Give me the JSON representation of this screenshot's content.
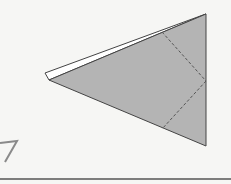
{
  "diagram": {
    "type": "origami-fold-step",
    "colors": {
      "background": "#f6f6f4",
      "paper_fill": "#b4b4b4",
      "flap_fill": "#ffffff",
      "outline": "#444444",
      "dashed": "#555555",
      "baseline": "#555555"
    },
    "shapes": {
      "main_triangle": [
        [
          49,
          80
        ],
        [
          206,
          14
        ],
        [
          206,
          146
        ]
      ],
      "back_flap": [
        [
          45,
          74
        ],
        [
          200,
          17
        ],
        [
          206,
          14
        ],
        [
          49,
          80
        ]
      ],
      "valley_fold_lines": [
        [
          [
            162,
            32
          ],
          [
            206,
            81
          ]
        ],
        [
          [
            206,
            81
          ],
          [
            162,
            129
          ]
        ]
      ],
      "step_numeral_fragment": "7",
      "baseline": [
        [
          0,
          179
        ],
        [
          231,
          179
        ]
      ]
    }
  }
}
